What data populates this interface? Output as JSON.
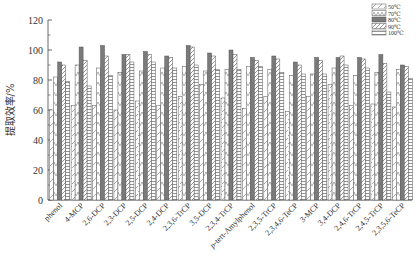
{
  "chart_data": {
    "type": "bar",
    "title": "",
    "xlabel": "",
    "ylabel": "提取效率/%",
    "ylim": [
      0,
      120
    ],
    "yticks": [
      0,
      20,
      40,
      60,
      80,
      100,
      120
    ],
    "grid": false,
    "legend_position": "top-right",
    "categories": [
      "phenol",
      "4-MCP",
      "2,6-DCP",
      "2,3-DCP",
      "2,5-DCP",
      "2,4-DCP",
      "2,3,6-TrCP",
      "3,5-DCP",
      "2,3,4-TrCP",
      "p-tert-Amylphenol",
      "2,3,5-TrCP",
      "2,3,4,6-TeCP",
      "3-MCP",
      "3,4-DCP",
      "2,4,6-TrCP",
      "2,4,5-TrCP",
      "2,3,5,6-TeCP"
    ],
    "series": [
      {
        "name": "50℃",
        "pattern": "diagonal-light",
        "values": [
          60,
          63,
          63,
          60,
          66,
          63,
          69,
          77,
          68,
          61,
          69,
          59,
          69,
          77,
          63,
          64,
          62
        ]
      },
      {
        "name": "70℃",
        "pattern": "chevron",
        "values": [
          82,
          90,
          88,
          85,
          86,
          88,
          89,
          86,
          87,
          89,
          87,
          83,
          84,
          88,
          83,
          85,
          87
        ]
      },
      {
        "name": "80℃",
        "pattern": "solid-gray",
        "values": [
          92,
          102,
          103,
          97,
          99,
          96,
          103,
          98,
          100,
          95,
          96,
          92,
          95,
          95,
          95,
          97,
          90
        ]
      },
      {
        "name": "90℃",
        "pattern": "diagonal-dense",
        "values": [
          90,
          93,
          96,
          97,
          97,
          95,
          102,
          96,
          97,
          93,
          94,
          90,
          93,
          96,
          94,
          91,
          89
        ]
      },
      {
        "name": "100℃",
        "pattern": "horizontal-lines",
        "values": [
          79,
          76,
          83,
          92,
          92,
          88,
          90,
          87,
          87,
          89,
          85,
          84,
          84,
          90,
          88,
          72,
          81
        ]
      }
    ]
  }
}
